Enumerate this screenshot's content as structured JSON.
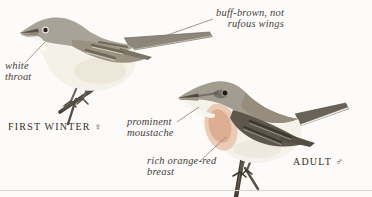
{
  "plate": {
    "background": "#fcfbf9",
    "divider_color": "#d8d5cd",
    "leader_color": "#867f73",
    "annotation_text_color": "#45403a",
    "caption_text_color": "#34302a"
  },
  "annotations": [
    {
      "id": "buff-brown-wings",
      "text": "buff-brown, not\nrufous wings"
    },
    {
      "id": "white-throat",
      "text": "white\nthroat"
    },
    {
      "id": "prominent-moustache",
      "text": "prominent\nmoustache"
    },
    {
      "id": "rich-orange-red-breast",
      "text": "rich orange-red\nbreast"
    }
  ],
  "captions": [
    {
      "id": "first-winter-female",
      "text": "FIRST WINTER ♀"
    },
    {
      "id": "adult-male",
      "text": "ADULT ♂"
    }
  ],
  "birds": [
    {
      "name": "first winter female",
      "colors": {
        "upperparts": "#a8a398",
        "wing": "#9a9180",
        "wing_feather_dark": "#6e6859",
        "wing_feather_edge": "#d3ccba",
        "tail": "#8d8779",
        "underparts": "#f4f1e8",
        "throat": "#fcfbf7",
        "beak": "#57524a",
        "legs": "#6f665a",
        "twig": "#47403a"
      }
    },
    {
      "name": "adult male",
      "colors": {
        "head": "#a29c91",
        "mantle": "#968d7c",
        "wing": "#5e584c",
        "wing_feather_dark": "#3f3a31",
        "wing_feather_edge": "#9a9280",
        "tail": "#696357",
        "tail_edge": "#eeebe2",
        "breast": "#dcab8e",
        "breast_soft": "#e9c7af",
        "moustache": "#f8f6f0",
        "underparts": "#f5f2ea",
        "beak": "#4e4942",
        "legs": "#5d564b",
        "twig": "#433d34"
      }
    }
  ]
}
